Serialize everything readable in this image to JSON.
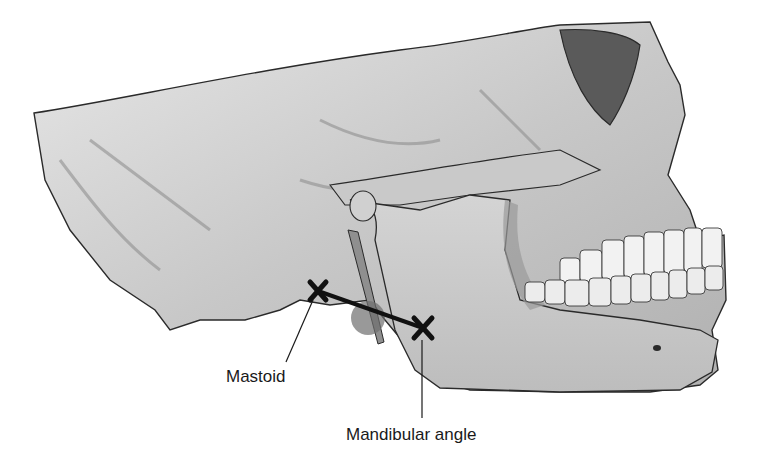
{
  "figure": {
    "labels": [
      {
        "id": "mastoid",
        "text": "Mastoid"
      },
      {
        "id": "mandibular_angle",
        "text": "Mandibular angle"
      }
    ],
    "markers": [
      {
        "id": "mastoid_marker",
        "symbol": "X",
        "x": 318,
        "y": 291
      },
      {
        "id": "mandibular_angle_marker",
        "symbol": "X",
        "x": 423,
        "y": 328
      }
    ],
    "connector": {
      "from": "mastoid_marker",
      "to": "mandibular_angle_marker"
    },
    "colors": {
      "bone_fill": "#d6d6d6",
      "bone_shadow": "#8c8c8c",
      "outline": "#2a2a2a",
      "teeth": "#f2f2f2",
      "marker": "#111111",
      "highlight_circle": "#6e6e6e"
    }
  }
}
